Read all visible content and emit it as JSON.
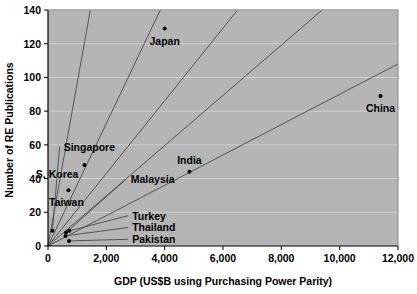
{
  "chart_data": {
    "type": "scatter",
    "title": "",
    "xlabel": "GDP (US$B using Purchasing Power Parity)",
    "ylabel": "Number of RE Publications",
    "xlim": [
      0,
      12000
    ],
    "ylim": [
      0,
      140
    ],
    "xticks": [
      0,
      2000,
      4000,
      6000,
      8000,
      10000,
      12000
    ],
    "xtick_labels": [
      "0",
      "2,000",
      "4,000",
      "6,000",
      "8,000",
      "10,000",
      "12,000"
    ],
    "yticks": [
      0,
      20,
      40,
      60,
      80,
      100,
      120,
      140
    ],
    "ytick_labels": [
      "0",
      "20",
      "40",
      "60",
      "80",
      "100",
      "120",
      "140"
    ],
    "grid": "horizontal",
    "legend": "none",
    "plot_background": "#b5b5b5",
    "page_background": "#ffffff",
    "gridline_color": "#cfcfcf",
    "marker_color": "#000000",
    "line_color": "#555555",
    "points": [
      {
        "name": "Japan",
        "x": 4000,
        "y": 129,
        "label_dx": 0,
        "label_dy": 16,
        "label_anchor": "middle",
        "leader": false
      },
      {
        "name": "China",
        "x": 11400,
        "y": 89,
        "label_dx": 0,
        "label_dy": 16,
        "label_anchor": "middle",
        "leader": false
      },
      {
        "name": "Singapore",
        "x": 150,
        "y": 9,
        "label_dx": 0,
        "label_dy": 0,
        "label_anchor": "start",
        "leader": true,
        "label_x": 400,
        "label_y": 59
      },
      {
        "name": "S. Korea",
        "x": 1250,
        "y": 48,
        "label_dx": -6,
        "label_dy": 13,
        "label_anchor": "end",
        "leader": false
      },
      {
        "name": "Taiwan",
        "x": 700,
        "y": 33,
        "label_dx": -2,
        "label_dy": 16,
        "label_anchor": "middle",
        "leader": false
      },
      {
        "name": "Malaysia",
        "x": 620,
        "y": 8,
        "label_dx": 0,
        "label_dy": 0,
        "label_anchor": "start",
        "leader": true,
        "label_x": 2700,
        "label_y": 40
      },
      {
        "name": "India",
        "x": 4850,
        "y": 44,
        "label_dx": 0,
        "label_dy": -8,
        "label_anchor": "middle",
        "leader": false
      },
      {
        "name": "Turkey",
        "x": 730,
        "y": 9,
        "label_dx": 0,
        "label_dy": 0,
        "label_anchor": "start",
        "leader": true,
        "label_x": 2750,
        "label_y": 18
      },
      {
        "name": "Thailand",
        "x": 600,
        "y": 6,
        "label_dx": 0,
        "label_dy": 0,
        "label_anchor": "start",
        "leader": true,
        "label_x": 2750,
        "label_y": 11
      },
      {
        "name": "Pakistan",
        "x": 720,
        "y": 3,
        "label_dx": 0,
        "label_dy": 0,
        "label_anchor": "start",
        "leader": true,
        "label_x": 2750,
        "label_y": 4
      }
    ],
    "trend_rays": [
      {
        "name": "ray-singapore",
        "x2": 1450,
        "y2": 140
      },
      {
        "name": "ray-skorea",
        "x2": 3850,
        "y2": 140
      },
      {
        "name": "ray-taiwan",
        "x2": 6500,
        "y2": 140
      },
      {
        "name": "ray-malaysia",
        "x2": 9400,
        "y2": 140
      },
      {
        "name": "ray-india",
        "x2": 12000,
        "y2": 108
      }
    ]
  }
}
